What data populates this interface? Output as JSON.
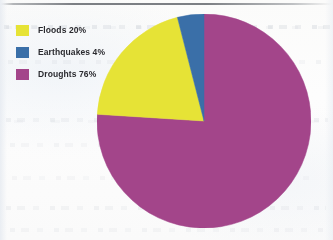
{
  "chart_data": {
    "type": "pie",
    "title": "",
    "subtitle": "",
    "xlabel": "",
    "ylabel": "",
    "grid": false,
    "legend_position": "top-left",
    "start_angle_deg": 0,
    "direction": "clockwise",
    "categories": [
      "Droughts",
      "Earthquakes",
      "Floods"
    ],
    "values": [
      76,
      20,
      4
    ],
    "unit": "%",
    "slices": [
      {
        "label": "Droughts",
        "value": 76,
        "value_text": "76%",
        "color": "#A3458A",
        "angle_deg": 273.6
      },
      {
        "label": "Floods",
        "value": 20,
        "value_text": "20%",
        "color": "#E6E336",
        "angle_deg": 72.0
      },
      {
        "label": "Earthquakes",
        "value": 4,
        "value_text": "4%",
        "color": "#3A6FA8",
        "angle_deg": 14.4
      }
    ],
    "annotations": []
  },
  "legend": {
    "items": [
      {
        "text": "Floods 20%",
        "label": "Floods",
        "value_text": "20%",
        "color": "#E6E336"
      },
      {
        "text": "Earthquakes 4%",
        "label": "Earthquakes",
        "value_text": "4%",
        "color": "#3A6FA8"
      },
      {
        "text": "Droughts 76%",
        "label": "Droughts",
        "value_text": "76%",
        "color": "#A3458A"
      }
    ]
  },
  "colors": {
    "floods": "#E6E336",
    "earthquakes": "#3A6FA8",
    "droughts": "#A3458A",
    "background": "#fcfcfb",
    "text": "#2b2b30"
  }
}
